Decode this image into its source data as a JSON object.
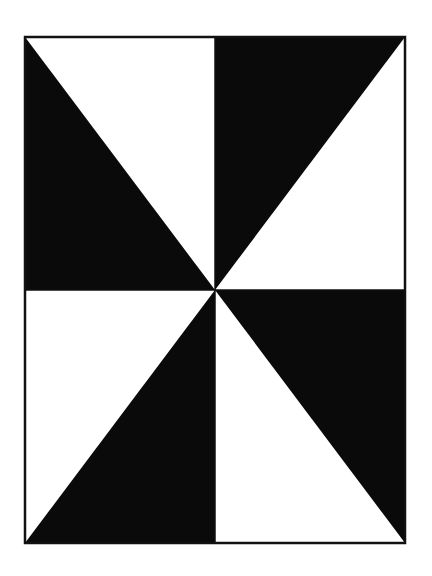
{
  "figure": {
    "type": "pinwheel-pattern",
    "frame": {
      "x": 25,
      "y": 37,
      "width": 380,
      "height": 506
    },
    "center": {
      "x": 215,
      "y": 290
    },
    "colors": {
      "fill": "#0a0a0a",
      "background": "#ffffff",
      "stroke": "#111111"
    },
    "quadrants": [
      {
        "name": "top-left",
        "shaded_triangle": "left-edge"
      },
      {
        "name": "top-right",
        "shaded_triangle": "top-edge"
      },
      {
        "name": "bottom-right",
        "shaded_triangle": "right-edge"
      },
      {
        "name": "bottom-left",
        "shaded_triangle": "bottom-edge"
      }
    ]
  }
}
